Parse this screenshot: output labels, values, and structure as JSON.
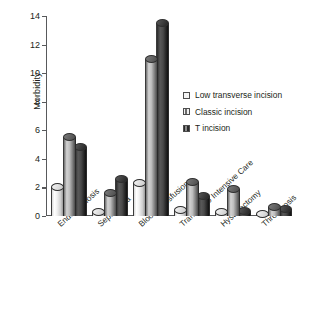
{
  "chart_data": {
    "type": "bar",
    "title": "",
    "xlabel": "",
    "ylabel": "Morbidity",
    "ylim": [
      0,
      14
    ],
    "yticks": [
      0,
      2,
      4,
      6,
      8,
      10,
      12,
      14
    ],
    "grid": false,
    "legend_position": "inside-right",
    "categories": [
      "Endometriosis",
      "Septicemia",
      "Blood transfusion",
      "Transfer to Intensive Care",
      "Hysterectomy",
      "Thrombosis"
    ],
    "series": [
      {
        "name": "Low transverse incision",
        "color": "#f2f2f2",
        "values": [
          2.0,
          0.3,
          2.3,
          0.4,
          0.3,
          0.15
        ]
      },
      {
        "name": "Classic incision",
        "color": "#a8a8a8",
        "values": [
          5.5,
          1.6,
          11.0,
          2.4,
          1.9,
          0.6
        ]
      },
      {
        "name": "T incision",
        "color": "#2b2b2b",
        "values": [
          4.8,
          2.6,
          13.5,
          1.4,
          0.35,
          0.5
        ]
      }
    ]
  },
  "legend": {
    "items": [
      {
        "label": "Low transverse incision"
      },
      {
        "label": "Classic incision"
      },
      {
        "label": "T incision"
      }
    ]
  },
  "axis": {
    "y_title": "Morbidity",
    "y_tick_labels": [
      "0",
      "2",
      "4",
      "6",
      "8",
      "10",
      "12",
      "14"
    ]
  }
}
